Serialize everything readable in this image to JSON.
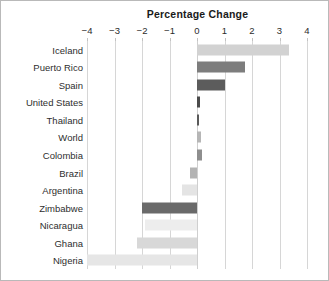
{
  "chart_data": {
    "type": "bar",
    "orientation": "horizontal",
    "title": "Percentage Change",
    "xlabel": "",
    "ylabel": "",
    "xlim": [
      -4,
      4
    ],
    "xticks": [
      -4,
      -3,
      -2,
      -1,
      0,
      1,
      2,
      3,
      4
    ],
    "xtick_labels": [
      "−4",
      "−3",
      "−2",
      "−1",
      "0",
      "1",
      "2",
      "3",
      "4"
    ],
    "xaxis_position": "top",
    "grid": true,
    "grid_axis": "x",
    "legend": "none",
    "categories": [
      "Iceland",
      "Puerto Rico",
      "Spain",
      "United States",
      "Thailand",
      "World",
      "Colombia",
      "Brazil",
      "Argentina",
      "Zimbabwe",
      "Nicaragua",
      "Ghana",
      "Nigeria"
    ],
    "values": [
      3.35,
      1.75,
      1.0,
      0.1,
      0.08,
      0.15,
      0.18,
      -0.25,
      -0.55,
      -2.0,
      -1.9,
      -2.2,
      -4.0
    ],
    "bar_colors": [
      "#d2d2d2",
      "#7d7d7d",
      "#5c5c5c",
      "#4a4a4a",
      "#5a5a5a",
      "#b6b6b6",
      "#8e8e8e",
      "#b3b3b3",
      "#e4e4e4",
      "#6a6a6a",
      "#ededed",
      "#d8d8d8",
      "#e6e6e6"
    ]
  },
  "style": {
    "background": "#ffffff",
    "frame_color": "#b9b9b9",
    "grid_color": "#d6d6d6",
    "title_color": "#1a1a1a",
    "tick_color": "#2b2b2b",
    "label_color": "#2e2e2e"
  }
}
